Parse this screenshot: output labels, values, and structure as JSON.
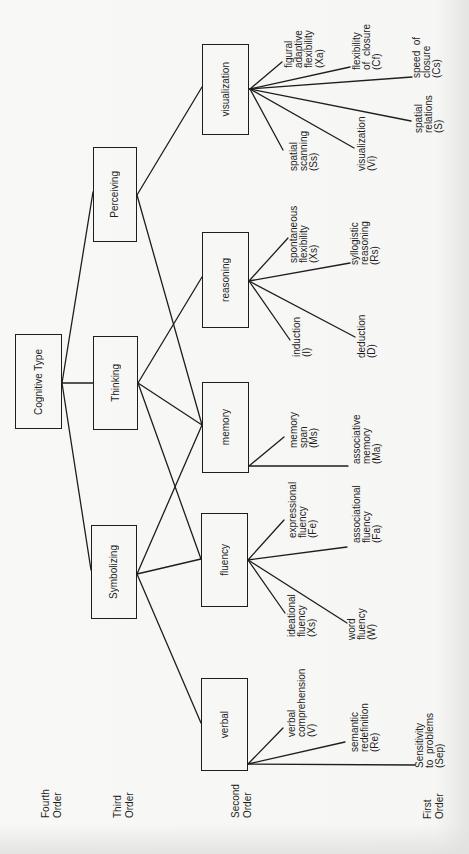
{
  "diagram": {
    "title": "Cognitive Type",
    "order_labels": {
      "fourth": "Fourth\nOrder",
      "third": "Third\nOrder",
      "second": "Second\nOrder",
      "first": "First\nOrder"
    },
    "fourth_order": {
      "cognitive_type": "Cognitive Type"
    },
    "third_order": {
      "perceiving": "Perceiving",
      "thinking": "Thinking",
      "symbolizing": "Symbolizing"
    },
    "second_order": {
      "visualization": "visualization",
      "reasoning": "reasoning",
      "memory": "memory",
      "fluency": "fluency",
      "verbal": "verbal"
    },
    "first_order": {
      "visualization": [
        "figural\nadaptive\nflexibility\n(Xa)",
        "flexibility\nof  closure\n(Cf)",
        "speed  of\nclosure\n(Cs)",
        "spatial\nrelations\n(S)",
        "visualization\n(Vi)",
        "spatial\nscanning\n(Ss)"
      ],
      "reasoning": [
        "spontaneous\nflexibility\n(Xs)",
        "syllogistic\nreasoning\n(Rs)",
        "induction\n(I)",
        "deduction\n(D)"
      ],
      "memory": [
        "memory\nspan\n(Ms)",
        "associative\nmemory\n(Ma)"
      ],
      "fluency": [
        "expressional\nfluency\n(Fe)",
        "associational\nfluency\n(Fa)",
        "ideational\nfluency\n(Xs)",
        "word\nfluency\n(W)"
      ],
      "verbal": [
        "verbal\ncomprehension\n(V)",
        "semantic\nredefinition\n(Re)",
        "Sensitivity\nto  problems\n(Sep)"
      ]
    },
    "edges": [
      [
        "Cognitive Type",
        "Perceiving"
      ],
      [
        "Cognitive Type",
        "Thinking"
      ],
      [
        "Cognitive Type",
        "Symbolizing"
      ],
      [
        "Perceiving",
        "visualization"
      ],
      [
        "Perceiving",
        "memory"
      ],
      [
        "Thinking",
        "reasoning"
      ],
      [
        "Thinking",
        "memory"
      ],
      [
        "Thinking",
        "fluency"
      ],
      [
        "Symbolizing",
        "memory"
      ],
      [
        "Symbolizing",
        "fluency"
      ],
      [
        "Symbolizing",
        "verbal"
      ]
    ],
    "colors": {
      "ink": "#1e1e1e",
      "paper": "#f7f7f5"
    }
  }
}
